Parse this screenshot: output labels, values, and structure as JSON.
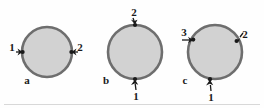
{
  "figure": {
    "background_color": "#fefefe",
    "circle_fill_color": "#d2d2d2",
    "circle_stroke_color": "#6e6e6e",
    "arrow_color": "#1a1a1a",
    "label_color": "#1a1a1a",
    "baseline_color": "#d8d8d8",
    "panels": [
      {
        "panel_label": "a",
        "circle": {
          "cx": 47,
          "cy": 52,
          "r": 25
        },
        "arrows": [
          {
            "label": "1",
            "position": "left",
            "direction": "inward-right"
          },
          {
            "label": "2",
            "position": "right",
            "direction": "inward-left"
          }
        ]
      },
      {
        "panel_label": "b",
        "circle": {
          "cx": 135,
          "cy": 52,
          "r": 27
        },
        "arrows": [
          {
            "label": "2",
            "position": "top",
            "direction": "inward-down"
          },
          {
            "label": "1",
            "position": "bottom",
            "direction": "inward-up"
          }
        ]
      },
      {
        "panel_label": "c",
        "circle": {
          "cx": 215,
          "cy": 52,
          "r": 27
        },
        "arrows": [
          {
            "label": "3",
            "position": "upper-left",
            "direction": "inward-right"
          },
          {
            "label": "2",
            "position": "upper-right",
            "direction": "inward-down-left"
          },
          {
            "label": "1",
            "position": "bottom",
            "direction": "inward-up"
          }
        ]
      }
    ]
  }
}
